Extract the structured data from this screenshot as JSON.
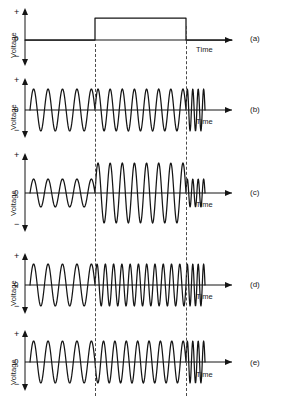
{
  "figure": {
    "width": 283,
    "height": 407,
    "background": "#ffffff",
    "trace_color": "#151515",
    "dashed_guide_color": "#4a4a4a"
  },
  "axis_labels": {
    "voltage": "Voltage",
    "plus": "+",
    "zero": "0",
    "minus": "−",
    "time": "Time"
  },
  "panels": [
    {
      "tag": "(a)",
      "name": "modulating-square-pulse",
      "ylabel": "Voltage",
      "xlabel": "Time",
      "baseline_y": 40,
      "description": "Modulating signal: rectangular pulse, low-high-low"
    },
    {
      "tag": "(b)",
      "name": "unmodulated-carrier",
      "ylabel": "Voltage",
      "xlabel": "Time",
      "baseline_y": 110,
      "description": "Unmodulated carrier: constant amplitude and frequency"
    },
    {
      "tag": "(c)",
      "name": "amplitude-modulated-wave",
      "ylabel": "Voltage",
      "xlabel": "Time",
      "baseline_y": 193,
      "description": "Amplitude modulation: amplitude increases during pulse"
    },
    {
      "tag": "(d)",
      "name": "frequency-modulated-wave",
      "ylabel": "Voltage",
      "xlabel": "Time",
      "baseline_y": 285,
      "description": "Frequency modulation: frequency increases during pulse"
    },
    {
      "tag": "(e)",
      "name": "phase-modulated-wave",
      "ylabel": "Voltage",
      "xlabel": "Time",
      "baseline_y": 362,
      "description": "Phase modulation: phase shifts at pulse edges"
    }
  ],
  "chart_data": {
    "type": "line",
    "xlabel": "Time",
    "ylabel": "Voltage",
    "grid": false,
    "legend": "none",
    "x_axis_start": 22,
    "x_axis_end": 232,
    "wave_start": 30,
    "wave_end": 205,
    "pulse_edges": [
      95,
      186
    ],
    "series": [
      {
        "name": "(a) modulating square pulse",
        "kind": "square",
        "low_level": 0,
        "high_level": 1,
        "rise_x": 95,
        "fall_x": 186,
        "amplitude_px": 22,
        "ylim": [
          -1,
          1
        ]
      },
      {
        "name": "(b) unmodulated carrier",
        "kind": "sine",
        "amplitude_px": 21,
        "cycles_before": 4.5,
        "cycles_inside": 7.5,
        "cycles_after": 3.5,
        "amplitude_inside_ratio": 1.0,
        "frequency_inside_ratio": 1.0,
        "phase_shift_deg": 0,
        "ylim": [
          -1,
          1
        ]
      },
      {
        "name": "(c) amplitude modulated",
        "kind": "sine",
        "amplitude_px": 14,
        "amplitude_inside_px": 30,
        "cycles_before": 4.5,
        "cycles_inside": 7.5,
        "cycles_after": 3.5,
        "amplitude_inside_ratio": 2.1,
        "frequency_inside_ratio": 1.0,
        "phase_shift_deg": 0,
        "ylim": [
          -1,
          1
        ]
      },
      {
        "name": "(d) frequency modulated",
        "kind": "sine",
        "amplitude_px": 21,
        "cycles_before": 4.5,
        "cycles_inside": 11,
        "cycles_after": 3.5,
        "amplitude_inside_ratio": 1.0,
        "frequency_inside_ratio": 1.55,
        "phase_shift_deg": 0,
        "ylim": [
          -1,
          1
        ]
      },
      {
        "name": "(e) phase modulated",
        "kind": "sine",
        "amplitude_px": 21,
        "cycles_before": 4.5,
        "cycles_inside": 8,
        "cycles_after": 3.5,
        "amplitude_inside_ratio": 1.0,
        "frequency_inside_ratio": 1.06,
        "phase_shift_deg": 180,
        "ylim": [
          -1,
          1
        ]
      }
    ]
  }
}
